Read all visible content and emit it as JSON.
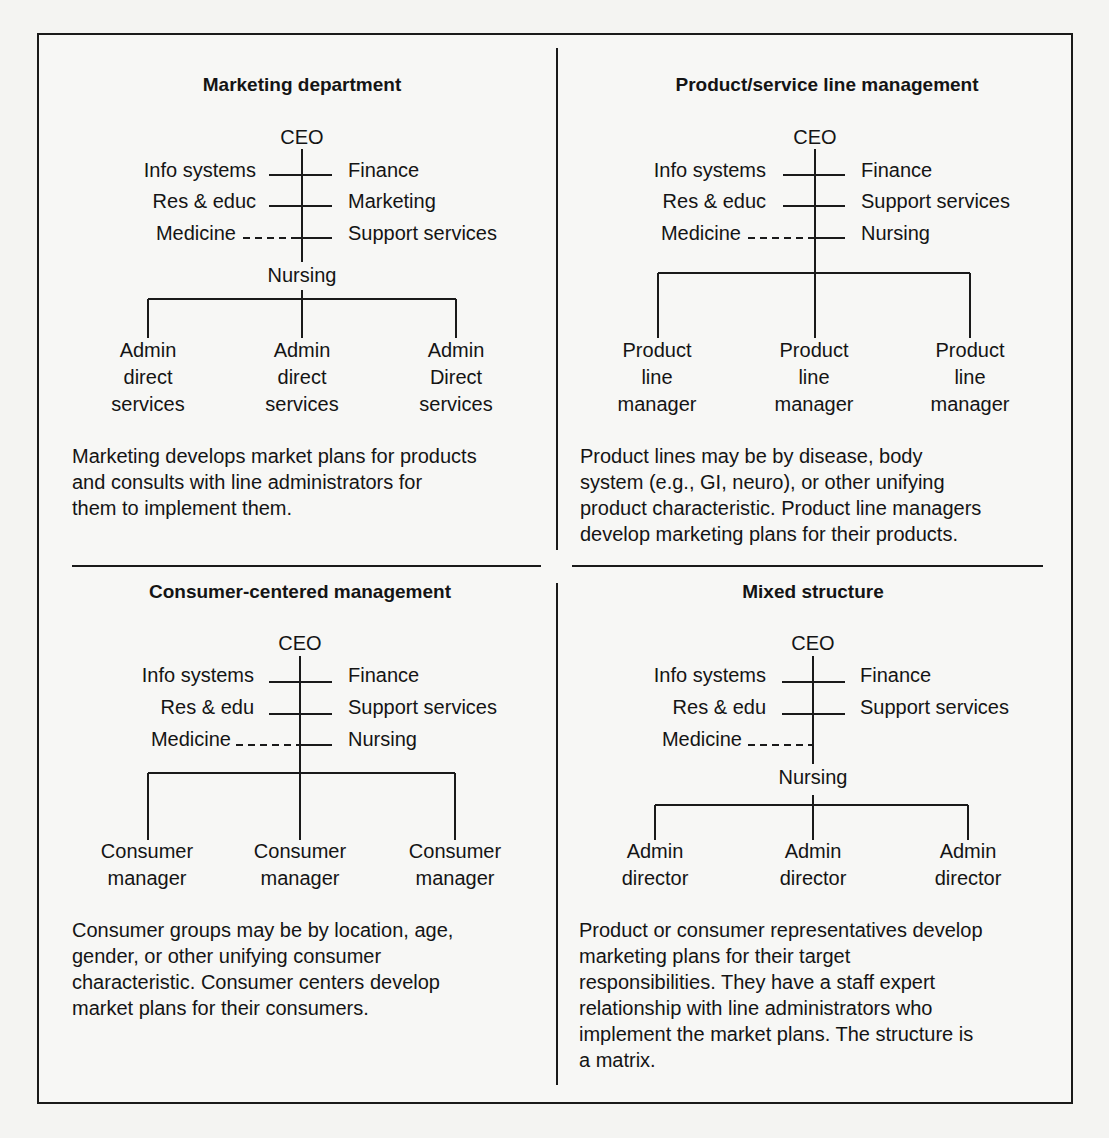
{
  "figure": {
    "quadrants": [
      {
        "title": "Marketing department",
        "top": "CEO",
        "left_units": [
          "Info systems",
          "Res & educ",
          "Medicine"
        ],
        "right_units": [
          "Finance",
          "Marketing",
          "Support services"
        ],
        "below_node": "Nursing",
        "children": [
          "Admin\ndirect\nservices",
          "Admin\ndirect\nservices",
          "Admin\nDirect\nservices"
        ],
        "description": "Marketing develops market plans for products\nand consults with line administrators for\nthem to implement them."
      },
      {
        "title": "Product/service line management",
        "top": "CEO",
        "left_units": [
          "Info systems",
          "Res & educ",
          "Medicine"
        ],
        "right_units": [
          "Finance",
          "Support services",
          "Nursing"
        ],
        "below_node": "",
        "children": [
          "Product\nline\nmanager",
          "Product\nline\nmanager",
          "Product\nline\nmanager"
        ],
        "description": "Product lines may be by disease, body\nsystem (e.g., GI, neuro), or other unifying\nproduct characteristic. Product line managers\ndevelop marketing plans for their products."
      },
      {
        "title": "Consumer-centered management",
        "top": "CEO",
        "left_units": [
          "Info systems",
          "Res & edu",
          "Medicine"
        ],
        "right_units": [
          "Finance",
          "Support services",
          "Nursing"
        ],
        "below_node": "",
        "children": [
          "Consumer\nmanager",
          "Consumer\nmanager",
          "Consumer\nmanager"
        ],
        "description": "Consumer groups may be by location, age,\ngender, or other unifying consumer\ncharacteristic. Consumer centers develop\nmarket plans for their consumers."
      },
      {
        "title": "Mixed structure",
        "top": "CEO",
        "left_units": [
          "Info systems",
          "Res & edu",
          "Medicine"
        ],
        "right_units": [
          "Finance",
          "Support services"
        ],
        "below_node": "Nursing",
        "children": [
          "Admin\ndirector",
          "Admin\ndirector",
          "Admin\ndirector"
        ],
        "description": "Product or consumer representatives develop\nmarketing plans for their target\nresponsibilities. They have a staff expert\nrelationship with line administrators who\nimplement the market plans. The structure is\na matrix."
      }
    ]
  }
}
